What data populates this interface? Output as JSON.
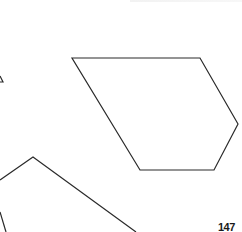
{
  "page": {
    "page_number": "147"
  },
  "figure": {
    "stroke_color": "#2a2a2a",
    "background": "#ffffff",
    "shapes": [
      {
        "name": "pentagon",
        "points": "72,58 200,58 238,124 214,170 140,170"
      },
      {
        "name": "lower-left-polygon-partial",
        "points": "0,180 33,157 136,232"
      },
      {
        "name": "lower-left-edge-partial",
        "points": "0,212 6,232"
      },
      {
        "name": "left-triangle-tip",
        "points": "0,76 3,82 0,82"
      }
    ]
  }
}
